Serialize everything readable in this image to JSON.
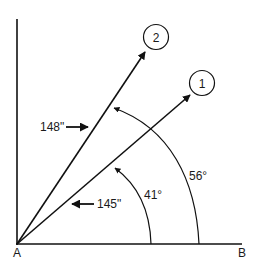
{
  "diagram": {
    "points": {
      "origin_label": "A",
      "end_label": "B"
    },
    "vectors": [
      {
        "id": "1",
        "label": "1",
        "angle_label": "41°",
        "angle_deg": 41,
        "length_label": "145\""
      },
      {
        "id": "2",
        "label": "2",
        "angle_label": "56°",
        "angle_deg": 56,
        "length_label": "148\""
      }
    ],
    "colors": {
      "stroke": "#111111",
      "background": "#ffffff"
    }
  }
}
